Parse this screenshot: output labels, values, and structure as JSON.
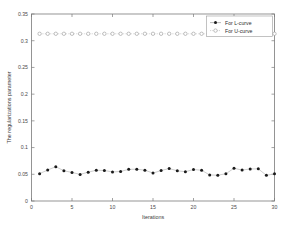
{
  "chart_data": {
    "type": "line",
    "title": "",
    "xlabel": "Iterations",
    "ylabel": "The regularizations parameter",
    "xlim": [
      0,
      30
    ],
    "ylim": [
      0,
      0.35
    ],
    "xticks": [
      "0",
      "5",
      "10",
      "15",
      "20",
      "25",
      "30"
    ],
    "xtick_values": [
      0,
      5,
      10,
      15,
      20,
      25,
      30
    ],
    "yticks": [
      "0",
      "0.05",
      "0.1",
      "0.15",
      "0.2",
      "0.25",
      "0.3",
      "0.35"
    ],
    "ytick_values": [
      0,
      0.05,
      0.1,
      0.15,
      0.2,
      0.25,
      0.3,
      0.35
    ],
    "grid": false,
    "legend_position": "top-right",
    "x": [
      1,
      2,
      3,
      4,
      5,
      6,
      7,
      8,
      9,
      10,
      11,
      12,
      13,
      14,
      15,
      16,
      17,
      18,
      19,
      20,
      21,
      22,
      23,
      24,
      25,
      26,
      27,
      28,
      29,
      30
    ],
    "series": [
      {
        "name": "For L-curve",
        "marker": "filled-circle",
        "color": "#1a1a1a",
        "values": [
          0.0512,
          0.058,
          0.0642,
          0.0565,
          0.0535,
          0.0497,
          0.054,
          0.0575,
          0.0572,
          0.0543,
          0.0553,
          0.0592,
          0.0596,
          0.0576,
          0.0523,
          0.057,
          0.0608,
          0.0565,
          0.0548,
          0.059,
          0.0575,
          0.0487,
          0.0483,
          0.051,
          0.0613,
          0.0578,
          0.06,
          0.0602,
          0.048,
          0.0508
        ]
      },
      {
        "name": "For U-curve",
        "marker": "open-circle",
        "color": "#8e8e8e",
        "values": [
          0.313,
          0.313,
          0.313,
          0.313,
          0.313,
          0.313,
          0.313,
          0.313,
          0.313,
          0.313,
          0.313,
          0.313,
          0.313,
          0.313,
          0.313,
          0.313,
          0.313,
          0.313,
          0.313,
          0.313,
          0.313,
          0.313,
          0.313,
          0.313,
          0.313,
          0.313,
          0.313,
          0.313,
          0.313,
          0.313
        ]
      }
    ]
  },
  "legend": {
    "entries": [
      {
        "label": "For L-curve"
      },
      {
        "label": "For U-curve"
      }
    ]
  }
}
